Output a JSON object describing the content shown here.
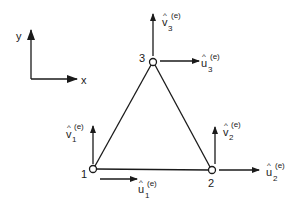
{
  "diagram": {
    "axes": {
      "x_label": "x",
      "y_label": "y"
    },
    "nodes": [
      {
        "id": "1",
        "label": "1"
      },
      {
        "id": "2",
        "label": "2"
      },
      {
        "id": "3",
        "label": "3"
      }
    ],
    "dofs": {
      "u1": {
        "base": "u",
        "hat": "^",
        "sub": "1",
        "sup": "(e)"
      },
      "v1": {
        "base": "v",
        "hat": "^",
        "sub": "1",
        "sup": "(e)"
      },
      "u2": {
        "base": "u",
        "hat": "^",
        "sub": "2",
        "sup": "(e)"
      },
      "v2": {
        "base": "v",
        "hat": "^",
        "sub": "2",
        "sup": "(e)"
      },
      "u3": {
        "base": "u",
        "hat": "^",
        "sub": "3",
        "sup": "(e)"
      },
      "v3": {
        "base": "v",
        "hat": "^",
        "sub": "3",
        "sup": "(e)"
      }
    },
    "colors": {
      "stroke": "#1a1a1a",
      "background": "#ffffff"
    }
  }
}
